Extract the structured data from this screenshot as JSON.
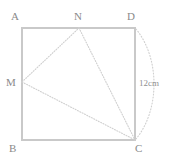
{
  "figure": {
    "shape_name": "square",
    "stroke_color": "#c9c9c9",
    "dotted_color": "#cfcfcf",
    "label_color": "#8a8a8a",
    "background": "#ffffff",
    "square": {
      "corners": [
        {
          "id": "A",
          "label": "A",
          "x": 22,
          "y": 28,
          "label_x": 11,
          "label_y": 11
        },
        {
          "id": "D",
          "label": "D",
          "x": 135,
          "y": 28,
          "label_x": 127,
          "label_y": 11
        },
        {
          "id": "C",
          "label": "C",
          "x": 135,
          "y": 140,
          "label_x": 135,
          "label_y": 143
        },
        {
          "id": "B",
          "label": "B",
          "x": 22,
          "y": 140,
          "label_x": 9,
          "label_y": 143
        }
      ]
    },
    "points": [
      {
        "id": "N",
        "label": "N",
        "x": 79,
        "y": 28,
        "label_x": 74,
        "label_y": 11,
        "on_edge": "AD"
      },
      {
        "id": "M",
        "label": "M",
        "x": 22,
        "y": 82,
        "label_x": 6,
        "label_y": 77,
        "on_edge": "AB"
      }
    ],
    "triangle": {
      "vertices": [
        "M",
        "N",
        "C"
      ],
      "style": "dotted",
      "segments": [
        {
          "from": "M",
          "to": "N"
        },
        {
          "from": "N",
          "to": "C"
        },
        {
          "from": "M",
          "to": "C"
        }
      ]
    },
    "arc": {
      "from": "D",
      "to": "C",
      "style": "dotted",
      "bulge": "right",
      "measure_label": "12cm",
      "label_x": 139,
      "label_y": 79
    }
  }
}
